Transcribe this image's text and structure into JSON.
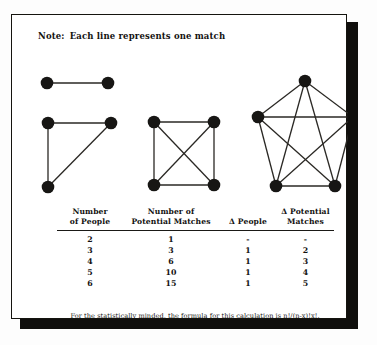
{
  "note": {
    "label": "Note:",
    "text": "Each line represents one match"
  },
  "diagrams": {
    "caption_hint": "complete graphs showing every pairwise match",
    "node_color": "#171614",
    "edge_color": "#2a2824",
    "graphs": [
      {
        "name": "two-person-graph",
        "people": 2,
        "edges": 1,
        "nodes": [
          [
            35,
            68
          ],
          [
            96,
            68
          ]
        ],
        "links": [
          [
            0,
            1
          ]
        ]
      },
      {
        "name": "three-person-graph",
        "people": 3,
        "edges": 3,
        "nodes": [
          [
            36,
            108
          ],
          [
            99,
            108
          ],
          [
            36,
            172
          ]
        ],
        "links": [
          [
            0,
            1
          ],
          [
            0,
            2
          ],
          [
            1,
            2
          ]
        ]
      },
      {
        "name": "four-person-graph",
        "people": 4,
        "edges": 6,
        "nodes": [
          [
            142,
            107
          ],
          [
            202,
            107
          ],
          [
            142,
            170
          ],
          [
            202,
            170
          ]
        ],
        "links": [
          [
            0,
            1
          ],
          [
            0,
            2
          ],
          [
            0,
            3
          ],
          [
            1,
            2
          ],
          [
            1,
            3
          ],
          [
            2,
            3
          ]
        ]
      },
      {
        "name": "five-person-graph",
        "people": 5,
        "edges": 10,
        "nodes": [
          [
            293,
            66
          ],
          [
            246,
            102
          ],
          [
            341,
            102
          ],
          [
            264,
            171
          ],
          [
            323,
            171
          ]
        ],
        "links": [
          [
            0,
            1
          ],
          [
            0,
            2
          ],
          [
            0,
            3
          ],
          [
            0,
            4
          ],
          [
            1,
            2
          ],
          [
            1,
            3
          ],
          [
            1,
            4
          ],
          [
            2,
            3
          ],
          [
            2,
            4
          ],
          [
            3,
            4
          ]
        ]
      }
    ]
  },
  "table": {
    "name": "potential-matches-table",
    "headers": [
      {
        "line1": "Number",
        "line2": "of People"
      },
      {
        "line1": "Number of",
        "line2": "Potential Matches"
      },
      {
        "line1": "",
        "line2": "Δ People"
      },
      {
        "line1": "Δ Potential",
        "line2": "Matches"
      }
    ],
    "rows": [
      {
        "people": "2",
        "matches": "1",
        "d_people": "-",
        "d_matches": "-"
      },
      {
        "people": "3",
        "matches": "3",
        "d_people": "1",
        "d_matches": "2"
      },
      {
        "people": "4",
        "matches": "6",
        "d_people": "1",
        "d_matches": "3"
      },
      {
        "people": "5",
        "matches": "10",
        "d_people": "1",
        "d_matches": "4"
      },
      {
        "people": "6",
        "matches": "15",
        "d_people": "1",
        "d_matches": "5"
      }
    ]
  },
  "footnote": {
    "text": "For the statistically minded, the formula for this calculation is n!/(n-x)!x!."
  }
}
